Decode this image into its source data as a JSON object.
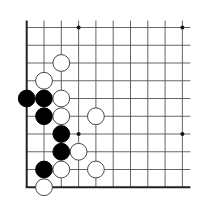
{
  "diagram": {
    "type": "go-board-fragment",
    "region": "lower-left corner",
    "columns": 10,
    "rows": 10,
    "origin": {
      "x": 26.7,
      "y": 27.5
    },
    "spacing": {
      "x": 17.3,
      "y": 17.75
    },
    "edges": [
      "left",
      "bottom"
    ],
    "line_color": "#555555",
    "edge_color": "#222222",
    "star_points": [
      [
        3,
        0
      ],
      [
        9,
        0
      ],
      [
        3,
        6
      ],
      [
        9,
        6
      ]
    ],
    "stones": [
      {
        "color": "white",
        "col": 2,
        "row": 2
      },
      {
        "color": "white",
        "col": 1,
        "row": 3
      },
      {
        "color": "black",
        "col": 0,
        "row": 4
      },
      {
        "color": "black",
        "col": 1,
        "row": 4
      },
      {
        "color": "white",
        "col": 2,
        "row": 4
      },
      {
        "color": "black",
        "col": 1,
        "row": 5
      },
      {
        "color": "white",
        "col": 2,
        "row": 5
      },
      {
        "color": "white",
        "col": 4,
        "row": 5
      },
      {
        "color": "black",
        "col": 2,
        "row": 6
      },
      {
        "color": "black",
        "col": 2,
        "row": 7
      },
      {
        "color": "white",
        "col": 3,
        "row": 7
      },
      {
        "color": "black",
        "col": 1,
        "row": 8
      },
      {
        "color": "white",
        "col": 2,
        "row": 8
      },
      {
        "color": "white",
        "col": 4,
        "row": 8
      },
      {
        "color": "white",
        "col": 1,
        "row": 9
      }
    ]
  }
}
